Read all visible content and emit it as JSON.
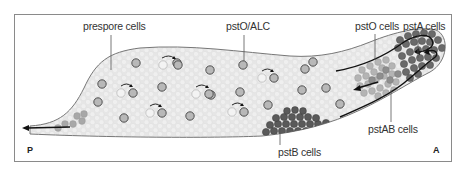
{
  "figure": {
    "type": "slug cell-type distribution diagram",
    "orientation": {
      "posterior_label": "P",
      "anterior_label": "A"
    },
    "labels": [
      {
        "id": "prespore",
        "text": "prespore cells"
      },
      {
        "id": "psto-alc",
        "text": "pstO/ALC"
      },
      {
        "id": "psto",
        "text": "pstO cells"
      },
      {
        "id": "psta",
        "text": "pstA cells"
      },
      {
        "id": "pstab",
        "text": "pstAB cells"
      },
      {
        "id": "pstb",
        "text": "pstB cells"
      }
    ],
    "colors": {
      "frame": "#8a8a8a",
      "slug_fill": "#e4e4e4",
      "slug_outline": "#777777",
      "background_cell": "#ececec",
      "alc_cell_fill": "#b8b8b8",
      "alc_cell_stroke": "#444444",
      "pale_cell_fill": "#f2f2f2",
      "psto_cell": "#b0b0b0",
      "psta_cell": "#6e6e6e",
      "pstb_cell": "#5a5a5a",
      "arrow": "#111111"
    }
  }
}
